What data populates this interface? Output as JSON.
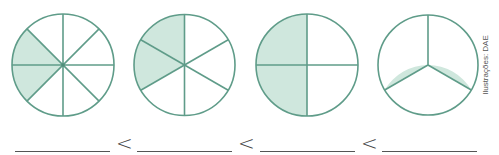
{
  "figure": {
    "type": "fraction-circles-comparison",
    "stroke_color": "#5f9c89",
    "fill_color": "#cfe7dd",
    "background_color": "#ffffff",
    "circles": [
      {
        "name": "circle-eighths",
        "parts": 8,
        "shaded": 2,
        "fraction": "2/8"
      },
      {
        "name": "circle-sixths",
        "parts": 6,
        "shaded": 2,
        "fraction": "2/6"
      },
      {
        "name": "circle-fourths",
        "parts": 4,
        "shaded": 2,
        "fraction": "2/4"
      },
      {
        "name": "circle-thirds",
        "parts": 3,
        "shaded": 2,
        "fraction": "2/3"
      }
    ],
    "credit": "Ilustrações: DAE"
  },
  "answer_row": {
    "blanks": [
      "",
      "",
      "",
      ""
    ],
    "separators": [
      "<",
      "<",
      "<"
    ]
  }
}
